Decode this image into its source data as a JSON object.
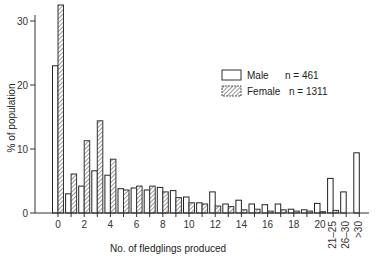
{
  "chart_data": {
    "type": "bar",
    "title": "",
    "xlabel": "No. of fledglings produced",
    "ylabel": "% of population",
    "ylim": [
      0,
      33
    ],
    "yticks": [
      0,
      10,
      20,
      30
    ],
    "grid": false,
    "legend_position": "upper right",
    "categories": [
      "0",
      "1",
      "2",
      "3",
      "4",
      "5",
      "6",
      "7",
      "8",
      "9",
      "10",
      "11",
      "12",
      "13",
      "14",
      "15",
      "16",
      "17",
      "18",
      "19",
      "20",
      "21–25",
      "26–30",
      ">30"
    ],
    "xtick_labels": {
      "0": "0",
      "2": "2",
      "4": "4",
      "6": "6",
      "8": "8",
      "10": "10",
      "12": "12",
      "14": "14",
      "16": "16",
      "18": "18",
      "20": "20",
      "21–25": "21–25",
      "26–30": "26–30",
      ">30": ">30"
    },
    "series": [
      {
        "name": "Male",
        "legend": "Male  n = 461",
        "style": "open",
        "values": [
          23.0,
          3.0,
          4.2,
          6.6,
          5.9,
          3.8,
          3.9,
          3.6,
          4.0,
          3.5,
          2.5,
          1.6,
          3.3,
          1.4,
          2.0,
          1.4,
          1.3,
          1.4,
          0.6,
          0.5,
          1.5,
          5.4,
          3.3,
          9.4
        ]
      },
      {
        "name": "Female",
        "legend": "Female  n = 1311",
        "style": "hatched",
        "values": [
          32.5,
          6.1,
          11.3,
          14.4,
          8.4,
          3.6,
          4.2,
          4.2,
          3.3,
          2.4,
          1.6,
          1.4,
          1.1,
          1.0,
          0.5,
          0.6,
          0.3,
          0.5,
          0.3,
          0.3,
          0.2,
          0.4,
          0.0,
          0.0
        ]
      }
    ]
  },
  "legend": {
    "male_label": "Male",
    "male_n": "n = 461",
    "female_label": "Female",
    "female_n": "n = 1311"
  },
  "axes": {
    "xlabel": "No. of fledglings produced",
    "ylabel": "% of population",
    "yticks": [
      "0",
      "10",
      "20",
      "30"
    ]
  }
}
